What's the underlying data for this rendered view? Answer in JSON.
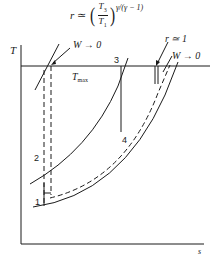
{
  "formula": {
    "lhs": "r",
    "relation": "≃",
    "numerator": "T",
    "numerator_sub": "3",
    "denominator": "T",
    "denominator_sub": "1",
    "exponent": "γ/(γ − 1)"
  },
  "axes": {
    "y_label": "T",
    "x_label": "s"
  },
  "annotations": {
    "tmax_label": "T",
    "tmax_sub": "max",
    "w_left": "W → 0",
    "w_right": "W → 0",
    "r_approx": "r ≃ 1"
  },
  "points": {
    "p1": "1",
    "p2": "2",
    "p3": "3",
    "p4": "4"
  },
  "colors": {
    "ink": "#1a1a1a",
    "background": "#ffffff"
  }
}
